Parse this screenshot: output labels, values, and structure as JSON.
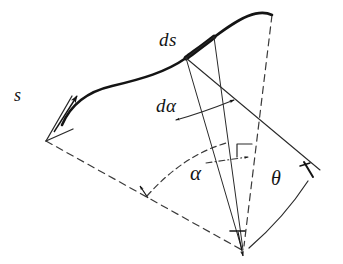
{
  "figure": {
    "kind": "hand-drawn-geometry-diagram",
    "background_color": "#ffffff",
    "ink_color": "#141414",
    "labels": {
      "arc_element": "ds",
      "angle_element": "dα",
      "arc_length": "s",
      "angle_alpha": "α",
      "angle_theta": "θ"
    },
    "strokes": {
      "curve_color": "#141414",
      "thin_color": "#2a2a2a",
      "dashed_color": "#3a3a3a",
      "curve_width": "2.6",
      "thick_segment_width": "4.6",
      "thin_width": "1.0",
      "dashed_width": "1.2",
      "dash_pattern": "7 5",
      "dashdot_pattern": "6 3 1 3"
    },
    "geometry": {
      "curve_path": "M 62 125 C 70 106, 86 92, 112 86 C 142 79, 166 72, 186 58 C 208 43, 228 24, 248 16 C 258 12, 266 12, 272 15",
      "thick_arc_segment": "M 186 58 C 196 51, 206 43, 216 36",
      "start_tick": "M 46 141 L 71 97",
      "start_foot": "M 46 141 L 71 128",
      "start_arrow_shaft": "M 55 133 L 77 95",
      "vertex": {
        "x": 242,
        "y": 250
      },
      "radial_to_ds_start": "M 242 250 L 186 58",
      "radial_to_ds_end": "M 242 250 L 216 36",
      "tangent_line": "M 186 58 L 318 169",
      "chord_short": "M 186 58 L 216 36",
      "vertical_dashed": "M 272 15 L 244 246",
      "dashed_base_left": "M 46 141 L 242 250",
      "dashed_arc_alpha": "M 147 196 C 170 170, 196 152, 226 143",
      "dashdot_radius": "M 210 162 L 252 156",
      "theta_arc": "M 250 247 C 272 228, 292 206, 309 180",
      "dalpha_arc": "M 172 121 C 190 117, 212 110, 232 102",
      "right_angle_mark": "M 236 145 L 236 158 M 236 145 L 252 145",
      "vertex_tick": "M 232 232 L 246 232",
      "tangent_end_tick": "M 305 163 L 314 177"
    }
  }
}
